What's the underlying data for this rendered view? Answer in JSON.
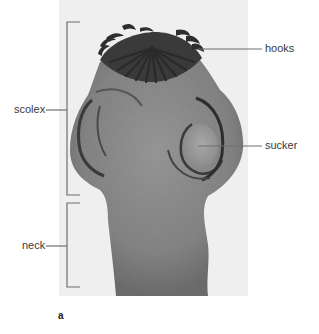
{
  "figure": {
    "panel_letter": "a",
    "labels": {
      "hooks": "hooks",
      "sucker": "sucker",
      "scolex": "scolex",
      "neck": "neck"
    },
    "colors": {
      "background": "#ffffff",
      "photo_background": "#efefef",
      "specimen_body": "#8c8c8c",
      "specimen_dark": "#2e2e2e",
      "leader_line": "#6e6e6e",
      "label_text": "#3a3a3a"
    }
  }
}
